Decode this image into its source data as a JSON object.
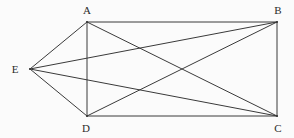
{
  "figure": {
    "kind": "graph-diagram",
    "name": "complete-graph-k5",
    "background_color": "#fbfbfb",
    "edge_color": "#3a3a3a",
    "edge_width": 1,
    "label_color": "#2b2b2b",
    "width": 294,
    "height": 138
  },
  "chart_data": {
    "type": "diagram",
    "title": "",
    "nodes": [
      {
        "id": "A",
        "label": "A",
        "x": 87,
        "y": 22,
        "label_x": 87,
        "label_y": 10
      },
      {
        "id": "B",
        "label": "B",
        "x": 277,
        "y": 22,
        "label_x": 278,
        "label_y": 10
      },
      {
        "id": "C",
        "label": "C",
        "x": 277,
        "y": 116,
        "label_x": 278,
        "label_y": 128
      },
      {
        "id": "D",
        "label": "D",
        "x": 87,
        "y": 116,
        "label_x": 86,
        "label_y": 128
      },
      {
        "id": "E",
        "label": "E",
        "x": 30,
        "y": 69,
        "label_x": 15,
        "label_y": 69
      }
    ],
    "edges": [
      {
        "from": "A",
        "to": "B"
      },
      {
        "from": "A",
        "to": "C"
      },
      {
        "from": "A",
        "to": "D"
      },
      {
        "from": "A",
        "to": "E"
      },
      {
        "from": "B",
        "to": "C"
      },
      {
        "from": "B",
        "to": "D"
      },
      {
        "from": "B",
        "to": "E"
      },
      {
        "from": "C",
        "to": "D"
      },
      {
        "from": "C",
        "to": "E"
      },
      {
        "from": "D",
        "to": "E"
      }
    ]
  }
}
